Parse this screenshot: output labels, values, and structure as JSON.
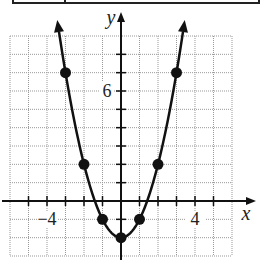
{
  "chart_data": {
    "type": "line",
    "title": "",
    "xlabel": "x",
    "ylabel": "y",
    "xlim": [
      -6,
      6
    ],
    "ylim": [
      -3,
      9
    ],
    "grid": true,
    "x_tick_labels": [
      {
        "value": -4,
        "label": "−4"
      },
      {
        "value": 4,
        "label": "4"
      }
    ],
    "y_tick_labels": [
      {
        "value": 6,
        "label": "6"
      }
    ],
    "function": "y = x^2 - 2",
    "points": [
      {
        "x": -3,
        "y": 7
      },
      {
        "x": -2,
        "y": 2
      },
      {
        "x": -1,
        "y": -1
      },
      {
        "x": 0,
        "y": -2
      },
      {
        "x": 1,
        "y": -1
      },
      {
        "x": 2,
        "y": 2
      },
      {
        "x": 3,
        "y": 7
      }
    ],
    "arrows_on_ends": true
  },
  "labels": {
    "x_axis": "x",
    "y_axis": "y",
    "tick_neg4": "−4",
    "tick_4": "4",
    "tick_6": "6"
  }
}
